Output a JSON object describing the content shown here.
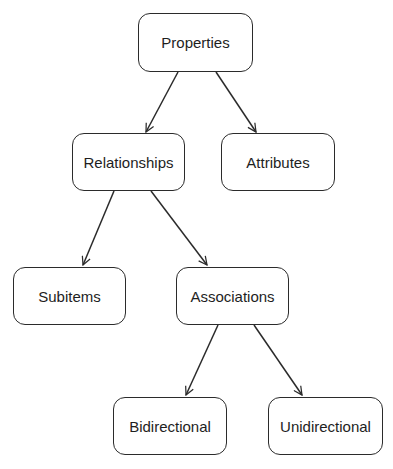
{
  "diagram": {
    "type": "tree",
    "colors": {
      "stroke": "#2b2b2b",
      "text": "#1e1e1e",
      "background": "#ffffff"
    },
    "nodes": [
      {
        "id": "properties",
        "label": "Properties",
        "x": 138,
        "y": 13,
        "w": 115,
        "h": 59
      },
      {
        "id": "relationships",
        "label": "Relationships",
        "x": 72,
        "y": 133,
        "w": 113,
        "h": 58
      },
      {
        "id": "attributes",
        "label": "Attributes",
        "x": 221,
        "y": 133,
        "w": 114,
        "h": 58
      },
      {
        "id": "subitems",
        "label": "Subitems",
        "x": 13,
        "y": 267,
        "w": 113,
        "h": 58
      },
      {
        "id": "associations",
        "label": "Associations",
        "x": 176,
        "y": 267,
        "w": 113,
        "h": 58
      },
      {
        "id": "bidirectional",
        "label": "Bidirectional",
        "x": 113,
        "y": 397,
        "w": 114,
        "h": 58
      },
      {
        "id": "unidirectional",
        "label": "Unidirectional",
        "x": 268,
        "y": 397,
        "w": 115,
        "h": 58
      }
    ],
    "edges": [
      {
        "from": "properties",
        "to": "relationships",
        "x1": 178,
        "y1": 72,
        "x2": 146,
        "y2": 132
      },
      {
        "from": "properties",
        "to": "attributes",
        "x1": 216,
        "y1": 72,
        "x2": 256,
        "y2": 132
      },
      {
        "from": "relationships",
        "to": "subitems",
        "x1": 114,
        "y1": 191,
        "x2": 83,
        "y2": 265
      },
      {
        "from": "relationships",
        "to": "associations",
        "x1": 151,
        "y1": 191,
        "x2": 207,
        "y2": 265
      },
      {
        "from": "associations",
        "to": "bidirectional",
        "x1": 218,
        "y1": 325,
        "x2": 186,
        "y2": 395
      },
      {
        "from": "associations",
        "to": "unidirectional",
        "x1": 254,
        "y1": 325,
        "x2": 302,
        "y2": 395
      }
    ]
  }
}
